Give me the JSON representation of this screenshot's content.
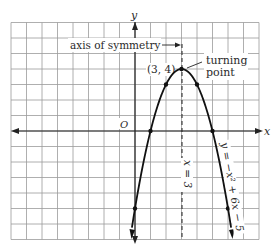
{
  "chart_data": {
    "type": "line",
    "title": "",
    "equation": "y = -x^2 + 6x - 5",
    "xlabel": "x",
    "ylabel": "y",
    "origin_label": "O",
    "xlim": [
      -8,
      8
    ],
    "ylim": [
      -7,
      7
    ],
    "grid": true,
    "points": [
      {
        "x": 0,
        "y": -5
      },
      {
        "x": 1,
        "y": 0
      },
      {
        "x": 2,
        "y": 3
      },
      {
        "x": 3,
        "y": 4
      },
      {
        "x": 4,
        "y": 3
      },
      {
        "x": 5,
        "y": 0
      },
      {
        "x": 6,
        "y": -5
      }
    ],
    "vertex": {
      "x": 3,
      "y": 4
    },
    "axis_of_symmetry": "x = 3",
    "annotations": {
      "axis_label": "axis of symmetry",
      "vertex_label": "(3, 4)",
      "turning_label_1": "turning",
      "turning_label_2": "point",
      "axis_line_label": "x = 3",
      "curve_label": "y = −x² + 6x − 5"
    }
  }
}
